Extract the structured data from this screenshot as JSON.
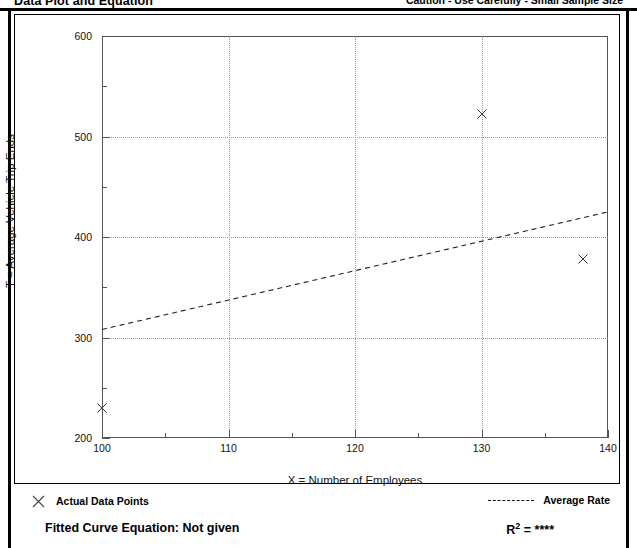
{
  "header": {
    "title": "Data Plot and Equation",
    "caution": "Caution - Use Carefully - Small Sample Size"
  },
  "legend": {
    "points_label": "Actual Data Points",
    "line_label": "Average Rate",
    "point_marker_icon": "x-marker-icon",
    "line_marker_icon": "dashed-line-icon"
  },
  "footer": {
    "equation_label": "Fitted Curve Equation:  Not given",
    "r2_prefix": "R",
    "r2_exponent": "2",
    "r2_value": "= ****"
  },
  "chart_data": {
    "type": "scatter",
    "title": "",
    "xlabel": "X = Number of Employees",
    "ylabel": "T = Average Vehicle Trip Ends",
    "xlim": [
      100,
      140
    ],
    "ylim": [
      200,
      600
    ],
    "x_major_ticks": [
      100,
      110,
      120,
      130,
      140
    ],
    "x_minor_ticks": [
      105,
      115,
      125,
      135
    ],
    "y_major_ticks": [
      200,
      300,
      400,
      500,
      600
    ],
    "y_minor_ticks": [
      250,
      350,
      450,
      550
    ],
    "x_tick_labels": [
      "100",
      "110",
      "120",
      "130",
      "140"
    ],
    "y_tick_labels": [
      "200",
      "300",
      "400",
      "500",
      "600"
    ],
    "grid": true,
    "grid_style": "dotted",
    "legend_position": "below-plot",
    "marker": "x",
    "points": [
      {
        "x": 100,
        "y": 230
      },
      {
        "x": 130,
        "y": 522
      },
      {
        "x": 138,
        "y": 378
      }
    ],
    "series": [
      {
        "name": "Actual Data Points",
        "type": "scatter",
        "x": [
          100,
          130,
          138
        ],
        "y": [
          230,
          522,
          378
        ]
      },
      {
        "name": "Average Rate",
        "type": "line",
        "style": "dashed",
        "x": [
          100,
          140
        ],
        "y": [
          308,
          425
        ]
      }
    ]
  },
  "colors": {
    "frame": "#000000",
    "axis": "#555555",
    "grid": "#9a9a9a",
    "marker": "#333333",
    "trend_line": "#222222",
    "background": "#ffffff"
  }
}
